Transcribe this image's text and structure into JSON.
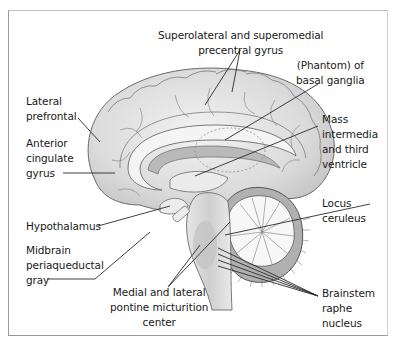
{
  "figure": {
    "type": "mid-sagittal brain section",
    "colors": {
      "cortex": "#d9d9d9",
      "cortex_light": "#ececec",
      "outline": "#6a6a6a",
      "cerebellum_band": "#9a9a9a",
      "leader_line": "#2a2a2a",
      "text": "#1a1a1a",
      "border": "#9a9a9a"
    }
  },
  "labels": {
    "precentral": {
      "line1": "Superolateral and superomedial",
      "line2": "precentral gyrus"
    },
    "basal_ganglia": {
      "line1": "(Phantom) of",
      "line2": "basal ganglia"
    },
    "lateral_prefrontal": {
      "line1": "Lateral",
      "line2": "prefrontal"
    },
    "anterior_cingulate": {
      "line1": "Anterior",
      "line2": "cingulate",
      "line3": "gyrus"
    },
    "mass_intermedia": {
      "line1": "Mass",
      "line2": "intermedia",
      "line3": "and third",
      "line4": "ventricle"
    },
    "hypothalamus": {
      "line1": "Hypothalamus"
    },
    "locus_ceruleus": {
      "line1": "Locus",
      "line2": "ceruleus"
    },
    "midbrain_pag": {
      "line1": "Midbrain",
      "line2": "periaqueductal",
      "line3": "gray"
    },
    "pontine": {
      "line1": "Medial and lateral",
      "line2": "pontine micturition",
      "line3": "center"
    },
    "raphe": {
      "line1": "Brainstem",
      "line2": "raphe",
      "line3": "nucleus"
    }
  }
}
